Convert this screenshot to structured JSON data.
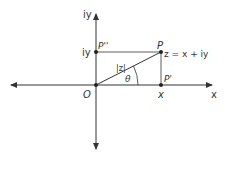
{
  "diagram": {
    "type": "argand-plane",
    "axes": {
      "x_label": "x",
      "y_label": "iy"
    },
    "points": {
      "origin": "O",
      "P": "P",
      "P_double_prime": "P''",
      "P_prime": "P'"
    },
    "labels": {
      "z_expression": "z = x + iy",
      "modulus": "|z|",
      "angle": "θ",
      "x_tick": "x",
      "iy_tick": "iy"
    },
    "colors": {
      "line": "#333333",
      "background": "#ffffff"
    }
  }
}
